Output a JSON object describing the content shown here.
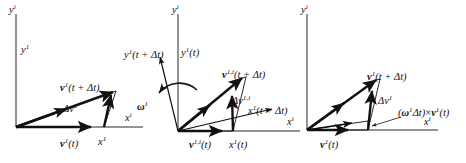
{
  "figure": {
    "background_color": "#ffffff",
    "axis_color": "#6f6f6f",
    "vector_color": "#111111",
    "width": 466,
    "height": 163
  },
  "panels": [
    {
      "id": "panel-1",
      "name": "inertial-frame-panel",
      "labels": {
        "y_axis_outer": "y",
        "y_axis_outer_sup": "i",
        "y_axis_inner": "y",
        "y_axis_inner_sup": "1",
        "x_axis_outer": "x",
        "x_axis_outer_sup": "i",
        "x_axis_inner": "x",
        "x_axis_inner_sup": "1",
        "v_initial": "v",
        "v_initial_sup": "1",
        "v_initial_arg": "(t)",
        "v_final": "v",
        "v_final_sup": "1",
        "v_final_arg": "(t + Δt)",
        "delta_v": "Δv",
        "delta_v_sup": "1"
      }
    },
    {
      "id": "panel-2",
      "name": "rotating-frame-panel",
      "labels": {
        "y_axis_outer": "y",
        "y_axis_outer_sup": "i",
        "y_axis_rotated": "y",
        "y_axis_rotated_sup": "1",
        "y_axis_rotated_arg": "(t + Δt)",
        "y_axis_inner": "y",
        "y_axis_inner_sup": "1",
        "y_axis_inner_arg": "(t)",
        "x_axis_outer": "x",
        "x_axis_outer_sup": "i",
        "x_axis_rotated": "x",
        "x_axis_rotated_sup": "1",
        "x_axis_rotated_arg": "(t + Δt)",
        "x_axis_inner": "x",
        "x_axis_inner_sup": "1",
        "x_axis_inner_arg": "(t)",
        "omega": "ω",
        "omega_sup": "1",
        "v_initial": "v",
        "v_initial_sup": "1,i",
        "v_initial_arg": "(t)",
        "v_final": "v",
        "v_final_sup": "1,i",
        "v_final_arg": "(t + Δt)",
        "delta_v": "Δv",
        "delta_v_sup": "1,i"
      }
    },
    {
      "id": "panel-3",
      "name": "coriolis-decomposition-panel",
      "labels": {
        "y_axis_outer": "y",
        "y_axis_outer_sup": "i",
        "x_axis_outer": "x",
        "x_axis_outer_sup": "i",
        "v_initial": "v",
        "v_initial_sup": "1",
        "v_initial_arg": "(t)",
        "v_final": "v",
        "v_final_sup": "1",
        "v_final_arg": "(t + Δt)",
        "delta_v": "Δv",
        "delta_v_sup": "1",
        "cross_term_open": "(",
        "cross_term_omega": "ω",
        "cross_term_omega_sup": "1",
        "cross_term_dt": "Δt",
        "cross_term_close": ")",
        "cross_term_times": "×",
        "cross_term_v": "v",
        "cross_term_v_sup": "1",
        "cross_term_v_arg": "(t)"
      }
    }
  ]
}
